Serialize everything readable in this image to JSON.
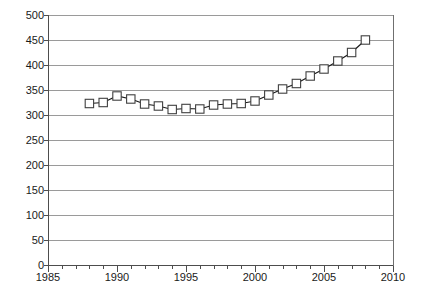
{
  "chart_data": {
    "type": "line",
    "title": "",
    "subtitle": "",
    "xlabel": "",
    "ylabel": "",
    "xlim": [
      1985,
      2010
    ],
    "ylim": [
      0,
      500
    ],
    "y_ticks": [
      0,
      50,
      100,
      150,
      200,
      250,
      300,
      350,
      400,
      450,
      500
    ],
    "y_tick_labels": [
      "0",
      "50",
      "100",
      "150",
      "200",
      "250",
      "300",
      "350",
      "400",
      "450",
      "500"
    ],
    "x_ticks": [
      1985,
      1990,
      1995,
      2000,
      2005,
      2010
    ],
    "x_tick_labels": [
      "1985",
      "1990",
      "1995",
      "2000",
      "2005",
      "2010"
    ],
    "x_minor_tick_step": 1,
    "grid": {
      "horizontal": true,
      "vertical": false,
      "color": "#9a9a9a"
    },
    "legend": {
      "visible": false,
      "position": "none",
      "entries": []
    },
    "marker": "open-square",
    "line_color": "#1a1a1a",
    "marker_fill": "#ffffff",
    "marker_edge_color": "#404040",
    "background_color": "#ffffff",
    "annotations": [],
    "series": [
      {
        "name": "series-1",
        "x": [
          1988,
          1989,
          1990,
          1991,
          1992,
          1993,
          1994,
          1995,
          1996,
          1997,
          1998,
          1999,
          2000,
          2001,
          2002,
          2003,
          2004,
          2005,
          2006,
          2007,
          2008
        ],
        "values": [
          323,
          325,
          338,
          332,
          322,
          318,
          311,
          313,
          312,
          320,
          322,
          323,
          328,
          340,
          352,
          363,
          378,
          392,
          408,
          425,
          450
        ]
      }
    ]
  }
}
